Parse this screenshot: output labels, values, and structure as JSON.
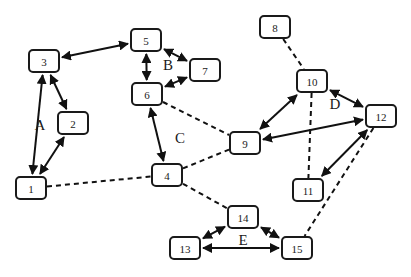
{
  "diagram": {
    "nodes": [
      {
        "id": "1",
        "label": "1",
        "x": 31,
        "y": 188
      },
      {
        "id": "2",
        "label": "2",
        "x": 73,
        "y": 123
      },
      {
        "id": "3",
        "label": "3",
        "x": 44,
        "y": 61
      },
      {
        "id": "4",
        "label": "4",
        "x": 167,
        "y": 175
      },
      {
        "id": "5",
        "label": "5",
        "x": 146,
        "y": 40
      },
      {
        "id": "6",
        "label": "6",
        "x": 147,
        "y": 94
      },
      {
        "id": "7",
        "label": "7",
        "x": 205,
        "y": 70
      },
      {
        "id": "8",
        "label": "8",
        "x": 275,
        "y": 27
      },
      {
        "id": "9",
        "label": "9",
        "x": 245,
        "y": 143
      },
      {
        "id": "10",
        "label": "10",
        "x": 312,
        "y": 81
      },
      {
        "id": "11",
        "label": "11",
        "x": 308,
        "y": 190
      },
      {
        "id": "12",
        "label": "12",
        "x": 381,
        "y": 116
      },
      {
        "id": "13",
        "label": "13",
        "x": 185,
        "y": 248
      },
      {
        "id": "14",
        "label": "14",
        "x": 243,
        "y": 217
      },
      {
        "id": "15",
        "label": "15",
        "x": 297,
        "y": 248
      }
    ],
    "regions": [
      {
        "label": "A",
        "x": 40,
        "y": 125
      },
      {
        "label": "B",
        "x": 168,
        "y": 65
      },
      {
        "label": "C",
        "x": 180,
        "y": 138
      },
      {
        "label": "D",
        "x": 335,
        "y": 104
      },
      {
        "label": "E",
        "x": 243,
        "y": 240
      }
    ],
    "edges": [
      {
        "from": "1",
        "to": "3",
        "style": "solid",
        "arrows": "both"
      },
      {
        "from": "1",
        "to": "2",
        "style": "solid",
        "arrows": "both"
      },
      {
        "from": "3",
        "to": "2",
        "style": "solid",
        "arrows": "both"
      },
      {
        "from": "3",
        "to": "5",
        "style": "solid",
        "arrows": "both"
      },
      {
        "from": "5",
        "to": "6",
        "style": "solid",
        "arrows": "both"
      },
      {
        "from": "5",
        "to": "7",
        "style": "solid",
        "arrows": "both"
      },
      {
        "from": "6",
        "to": "7",
        "style": "solid",
        "arrows": "both"
      },
      {
        "from": "6",
        "to": "4",
        "style": "solid",
        "arrows": "both"
      },
      {
        "from": "6",
        "to": "9",
        "style": "dashed",
        "arrows": "none"
      },
      {
        "from": "1",
        "to": "4",
        "style": "dashed",
        "arrows": "none"
      },
      {
        "from": "4",
        "to": "9",
        "style": "dashed",
        "arrows": "none"
      },
      {
        "from": "4",
        "to": "14",
        "style": "dashed",
        "arrows": "none"
      },
      {
        "from": "8",
        "to": "10",
        "style": "dashed",
        "arrows": "none"
      },
      {
        "from": "10",
        "to": "11",
        "style": "dashed",
        "arrows": "none"
      },
      {
        "from": "9",
        "to": "10",
        "style": "solid",
        "arrows": "both"
      },
      {
        "from": "9",
        "to": "12",
        "style": "solid",
        "arrows": "both"
      },
      {
        "from": "10",
        "to": "12",
        "style": "solid",
        "arrows": "both"
      },
      {
        "from": "12",
        "to": "11",
        "style": "solid",
        "arrows": "both"
      },
      {
        "from": "12",
        "to": "15",
        "style": "dashed",
        "arrows": "none"
      },
      {
        "from": "13",
        "to": "14",
        "style": "solid",
        "arrows": "both"
      },
      {
        "from": "14",
        "to": "15",
        "style": "solid",
        "arrows": "both"
      },
      {
        "from": "13",
        "to": "15",
        "style": "solid",
        "arrows": "both"
      }
    ]
  }
}
